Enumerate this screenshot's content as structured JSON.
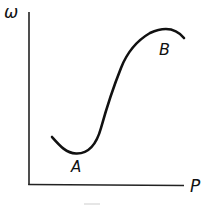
{
  "figure": {
    "y_axis_label": "ω",
    "x_axis_label": "P",
    "points": [
      {
        "label": "A",
        "description": "minimum of curve"
      },
      {
        "label": "B",
        "description": "maximum of curve"
      }
    ],
    "colors": {
      "ink": "#111111",
      "background": "#ffffff"
    }
  }
}
